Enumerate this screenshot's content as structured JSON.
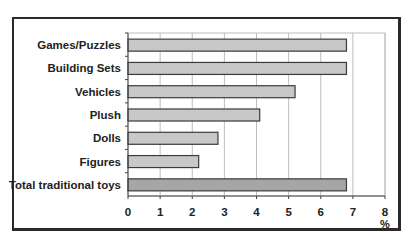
{
  "chart_data": {
    "type": "bar",
    "orientation": "horizontal",
    "title": "",
    "categories": [
      "Games/Puzzles",
      "Building Sets",
      "Vehicles",
      "Plush",
      "Dolls",
      "Figures",
      "Total traditional toys"
    ],
    "values": [
      6.8,
      6.8,
      5.2,
      4.1,
      2.8,
      2.2,
      6.8
    ],
    "xlabel": "%",
    "ylabel": "",
    "xlim": [
      0,
      8
    ],
    "xticks": [
      0,
      1,
      2,
      3,
      4,
      5,
      6,
      7,
      8
    ],
    "grid": true,
    "legend": null,
    "colors": {
      "bar": "#c8c8c8",
      "total_bar": "#a6a6a6",
      "bar_border": "#3a3a3a",
      "grid": "#bdbdbd",
      "frame": "#2a2a2a",
      "text": "#222222"
    }
  }
}
